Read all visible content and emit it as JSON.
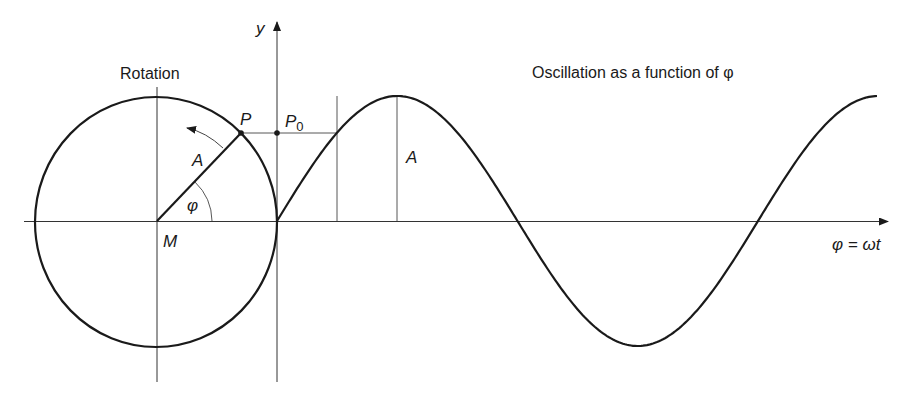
{
  "diagram": {
    "type": "rotation-to-oscillation",
    "colors": {
      "stroke": "#1a1a1a",
      "background": "#ffffff",
      "thin_line": "#333333"
    },
    "labels": {
      "rotation_title": "Rotation",
      "oscillation_title": "Oscillation as a function of φ",
      "y_axis": "y",
      "x_axis": "φ = ωt",
      "point_p": "P",
      "point_p0_main": "P",
      "point_p0_sub": "0",
      "radius_amplitude": "A",
      "angle": "φ",
      "center": "M",
      "curve_amplitude": "A"
    },
    "geometry": {
      "circle_center": [
        156,
        222
      ],
      "circle_radius_x": 121,
      "circle_radius_y": 125,
      "angle_degrees": 43,
      "x_axis_y": 221,
      "y_axis_x": 277,
      "amplitude_px": 125,
      "period_px": 481,
      "curve_start_x": 277,
      "curve_end_x": 878
    }
  }
}
